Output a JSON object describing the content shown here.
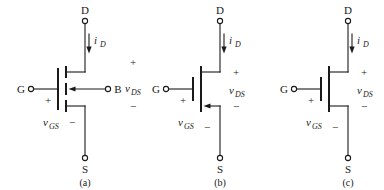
{
  "figure": {
    "background": "#ffffff",
    "ink": "#1a1a1a"
  },
  "labels": {
    "drain": "D",
    "source": "S",
    "gate": "G",
    "bulk": "B",
    "current_drain": "i",
    "current_drain_sub": "D",
    "v_ds": "v",
    "v_ds_sub": "DS",
    "v_gs": "v",
    "v_gs_sub": "GS",
    "plus": "+",
    "minus": "−"
  },
  "circuits": [
    {
      "id": "a",
      "caption": "(a)",
      "has_bulk_terminal": true,
      "bulk_label": "B",
      "channel_style": "segmented",
      "arrow_location": "bulk",
      "arrow_direction": "left",
      "terminals": [
        "D",
        "G",
        "B",
        "S"
      ],
      "annotations": [
        "i_D",
        "v_DS",
        "v_GS"
      ]
    },
    {
      "id": "b",
      "caption": "(b)",
      "has_bulk_terminal": false,
      "bulk_label": "",
      "channel_style": "continuous",
      "arrow_location": "source",
      "arrow_direction": "left",
      "terminals": [
        "D",
        "G",
        "S"
      ],
      "annotations": [
        "i_D",
        "v_DS",
        "v_GS"
      ]
    },
    {
      "id": "c",
      "caption": "(c)",
      "has_bulk_terminal": false,
      "bulk_label": "",
      "channel_style": "continuous",
      "arrow_location": "none",
      "arrow_direction": "",
      "terminals": [
        "D",
        "G",
        "S"
      ],
      "annotations": [
        "i_D",
        "v_DS",
        "v_GS"
      ]
    }
  ]
}
